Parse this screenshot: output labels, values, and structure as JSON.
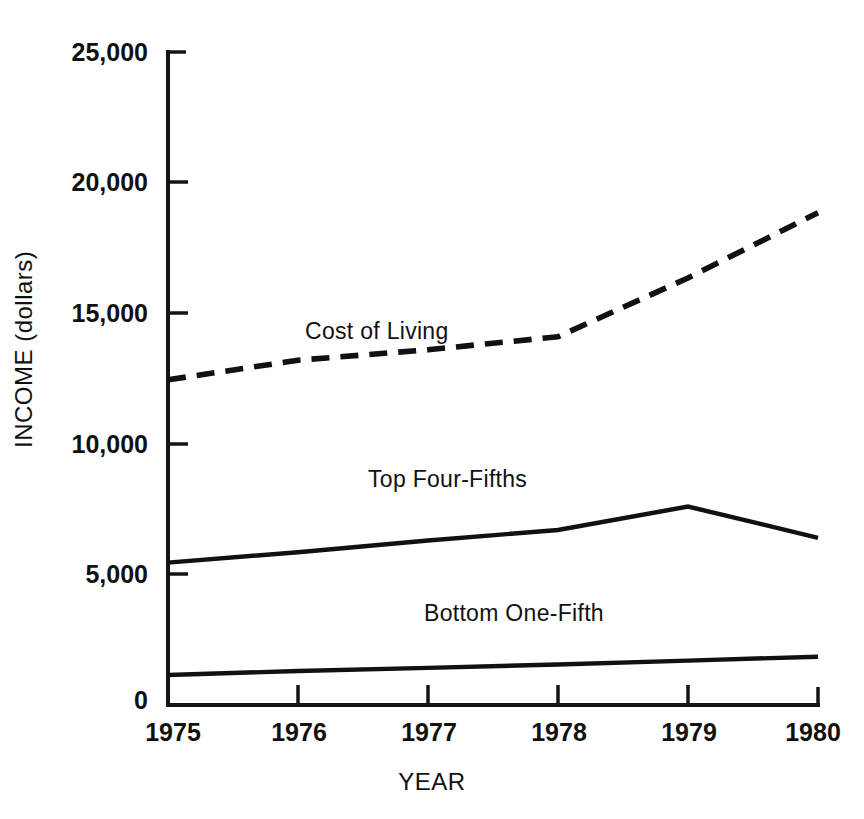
{
  "chart_data": {
    "type": "line",
    "title": "",
    "subtitle": "",
    "xlabel": "YEAR",
    "ylabel": "INCOME (dollars)",
    "x": [
      1975,
      1976,
      1977,
      1978,
      1979,
      1980
    ],
    "categories": [
      "1975",
      "1976",
      "1977",
      "1978",
      "1979",
      "1980"
    ],
    "xlim": [
      1975,
      1980
    ],
    "ylim": [
      0,
      25000
    ],
    "xticks": [
      "1975",
      "1976",
      "1977",
      "1978",
      "1979",
      "1980"
    ],
    "yticks": [
      "0",
      "5,000",
      "10,000",
      "15,000",
      "20,000",
      "25,000"
    ],
    "ytick_values": [
      0,
      5000,
      10000,
      15000,
      20000,
      25000
    ],
    "grid": false,
    "legend_position": "inline-annotations",
    "series": [
      {
        "name": "Cost of Living",
        "style": "dashed",
        "color": "#111111",
        "values": [
          12450,
          13200,
          13600,
          14100,
          16350,
          18850
        ],
        "label": "Cost of Living"
      },
      {
        "name": "Top Four-Fifths",
        "style": "solid",
        "color": "#111111",
        "values": [
          5450,
          5850,
          6300,
          6700,
          7600,
          6400
        ],
        "label": "Top Four-Fifths"
      },
      {
        "name": "Bottom One-Fifth",
        "style": "solid",
        "color": "#111111",
        "values": [
          1150,
          1300,
          1420,
          1550,
          1700,
          1850
        ],
        "label": "Bottom One-Fifth"
      }
    ],
    "annotations": [
      {
        "text": "Cost of Living",
        "series": "Cost of Living"
      },
      {
        "text": "Top Four-Fifths",
        "series": "Top Four-Fifths"
      },
      {
        "text": "Bottom One-Fifth",
        "series": "Bottom One-Fifth"
      }
    ]
  },
  "axes": {
    "y_title": "INCOME (dollars)",
    "x_title": "YEAR",
    "y_tick_labels": [
      "25,000",
      "20,000",
      "15,000",
      "10,000",
      "5,000",
      "0"
    ],
    "x_tick_labels": [
      "1975",
      "1976",
      "1977",
      "1978",
      "1979",
      "1980"
    ]
  },
  "annotations": {
    "cost_of_living": "Cost of Living",
    "top_four_fifths": "Top Four-Fifths",
    "bottom_one_fifth": "Bottom One-Fifth"
  },
  "colors": {
    "ink": "#111111",
    "background": "#ffffff"
  }
}
